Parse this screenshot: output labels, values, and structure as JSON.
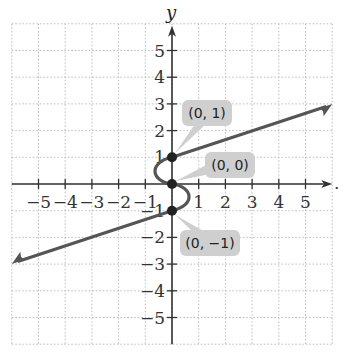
{
  "chart_data": {
    "type": "line",
    "title": "",
    "xlabel": "",
    "ylabel": "y",
    "xlim": [
      -6,
      6
    ],
    "ylim": [
      -6,
      6
    ],
    "grid": true,
    "x_ticks": [
      -5,
      -4,
      -3,
      -2,
      -1,
      1,
      2,
      3,
      4,
      5
    ],
    "y_ticks": [
      5,
      4,
      3,
      2,
      1,
      -1,
      -2,
      -3,
      -4,
      -5
    ],
    "x_tick_labels": [
      "−5",
      "−4",
      "−3",
      "−2",
      "−1",
      "1",
      "2",
      "3",
      "4",
      "5"
    ],
    "y_tick_labels": [
      "5",
      "4",
      "3",
      "2",
      "1",
      "−1",
      "−2",
      "−3",
      "−4",
      "−5"
    ],
    "series": [
      {
        "name": "curve",
        "description": "Ray from (0,1) to the upper right with arrow, S-shaped curve through (0,1), (0,0), (0,-1), ray from (0,-1) to the lower left with arrow",
        "upper_ray": {
          "from": [
            0,
            1
          ],
          "to": [
            6,
            3
          ]
        },
        "s_curve": [
          [
            0,
            1
          ],
          [
            -0.6,
            0.6
          ],
          [
            -0.5,
            0.2
          ],
          [
            0,
            0
          ],
          [
            0.5,
            -0.2
          ],
          [
            0.6,
            -0.6
          ],
          [
            0,
            -1
          ]
        ],
        "lower_ray": {
          "from": [
            0,
            -1
          ],
          "to": [
            -6,
            -3
          ]
        }
      }
    ],
    "points": [
      {
        "x": 0,
        "y": 1,
        "label": "(0, 1)"
      },
      {
        "x": 0,
        "y": 0,
        "label": "(0, 0)"
      },
      {
        "x": 0,
        "y": -1,
        "label": "(0, −1)"
      }
    ],
    "colors": {
      "curve": "#555555",
      "axis": "#333333",
      "grid": "#bbbbbb",
      "callout_bg": "#cfcfcf"
    }
  },
  "labels": {
    "y_axis": "y",
    "x_axis_dot": "."
  }
}
